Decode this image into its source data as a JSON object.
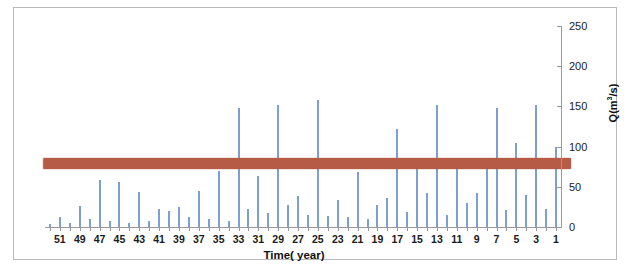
{
  "figure": {
    "background_color": "#ffffff",
    "frame_color": "#b9b9b9",
    "bar_color": "#7f9fd4",
    "band_color": "#c0604a",
    "axis_color": "#9a9a9a"
  },
  "axis_titles": {
    "x": "Time( year)",
    "y_prefix": "Q(m",
    "y_sup": "3",
    "y_suffix": "/s)",
    "y_full": "Q(m3/s)"
  },
  "chart_data": {
    "type": "bar",
    "title": "",
    "subtitle": "",
    "xlabel": "Time( year)",
    "ylabel": "Q(m3/s)",
    "ylim": [
      0,
      250
    ],
    "yticks": [
      0,
      50,
      100,
      150,
      200,
      250
    ],
    "ytick_labels": [
      "0",
      "50",
      "100",
      "150",
      "200",
      "250"
    ],
    "xlim_note": "Categories descend from 52 on the left to 1 on the right; only odd values are labeled.",
    "xtick_labels": [
      "51",
      "49",
      "47",
      "45",
      "43",
      "41",
      "39",
      "37",
      "35",
      "33",
      "31",
      "29",
      "27",
      "25",
      "23",
      "21",
      "19",
      "17",
      "15",
      "13",
      "11",
      "9",
      "7",
      "5",
      "3",
      "1"
    ],
    "grid": false,
    "legend": null,
    "legend_position": "none",
    "annotations": [
      {
        "type": "horizontal_band",
        "label": "threshold band",
        "color": "#c0604a",
        "y_center": 79,
        "y_low": 72,
        "y_high": 86,
        "spans_full_width": true
      }
    ],
    "categories": [
      52,
      51,
      50,
      49,
      48,
      47,
      46,
      45,
      44,
      43,
      42,
      41,
      40,
      39,
      38,
      37,
      36,
      35,
      34,
      33,
      32,
      31,
      30,
      29,
      28,
      27,
      26,
      25,
      24,
      23,
      22,
      21,
      20,
      19,
      18,
      17,
      16,
      15,
      14,
      13,
      12,
      11,
      10,
      9,
      8,
      7,
      6,
      5,
      4,
      3,
      2,
      1
    ],
    "values": [
      4,
      12,
      5,
      26,
      10,
      58,
      8,
      56,
      5,
      43,
      7,
      22,
      20,
      25,
      12,
      45,
      10,
      70,
      8,
      148,
      23,
      64,
      18,
      152,
      27,
      38,
      15,
      158,
      14,
      33,
      12,
      68,
      10,
      28,
      36,
      122,
      19,
      78,
      42,
      152,
      15,
      72,
      30,
      42,
      83,
      148,
      21,
      104,
      40,
      152,
      23,
      100
    ],
    "series": [
      {
        "name": "Q",
        "color": "#7f9fd4",
        "values": [
          4,
          12,
          5,
          26,
          10,
          58,
          8,
          56,
          5,
          43,
          7,
          22,
          20,
          25,
          12,
          45,
          10,
          70,
          8,
          148,
          23,
          64,
          18,
          152,
          27,
          38,
          15,
          158,
          14,
          33,
          12,
          68,
          10,
          28,
          36,
          122,
          19,
          78,
          42,
          152,
          15,
          72,
          30,
          42,
          83,
          148,
          21,
          104,
          40,
          152,
          23,
          100
        ]
      }
    ]
  }
}
